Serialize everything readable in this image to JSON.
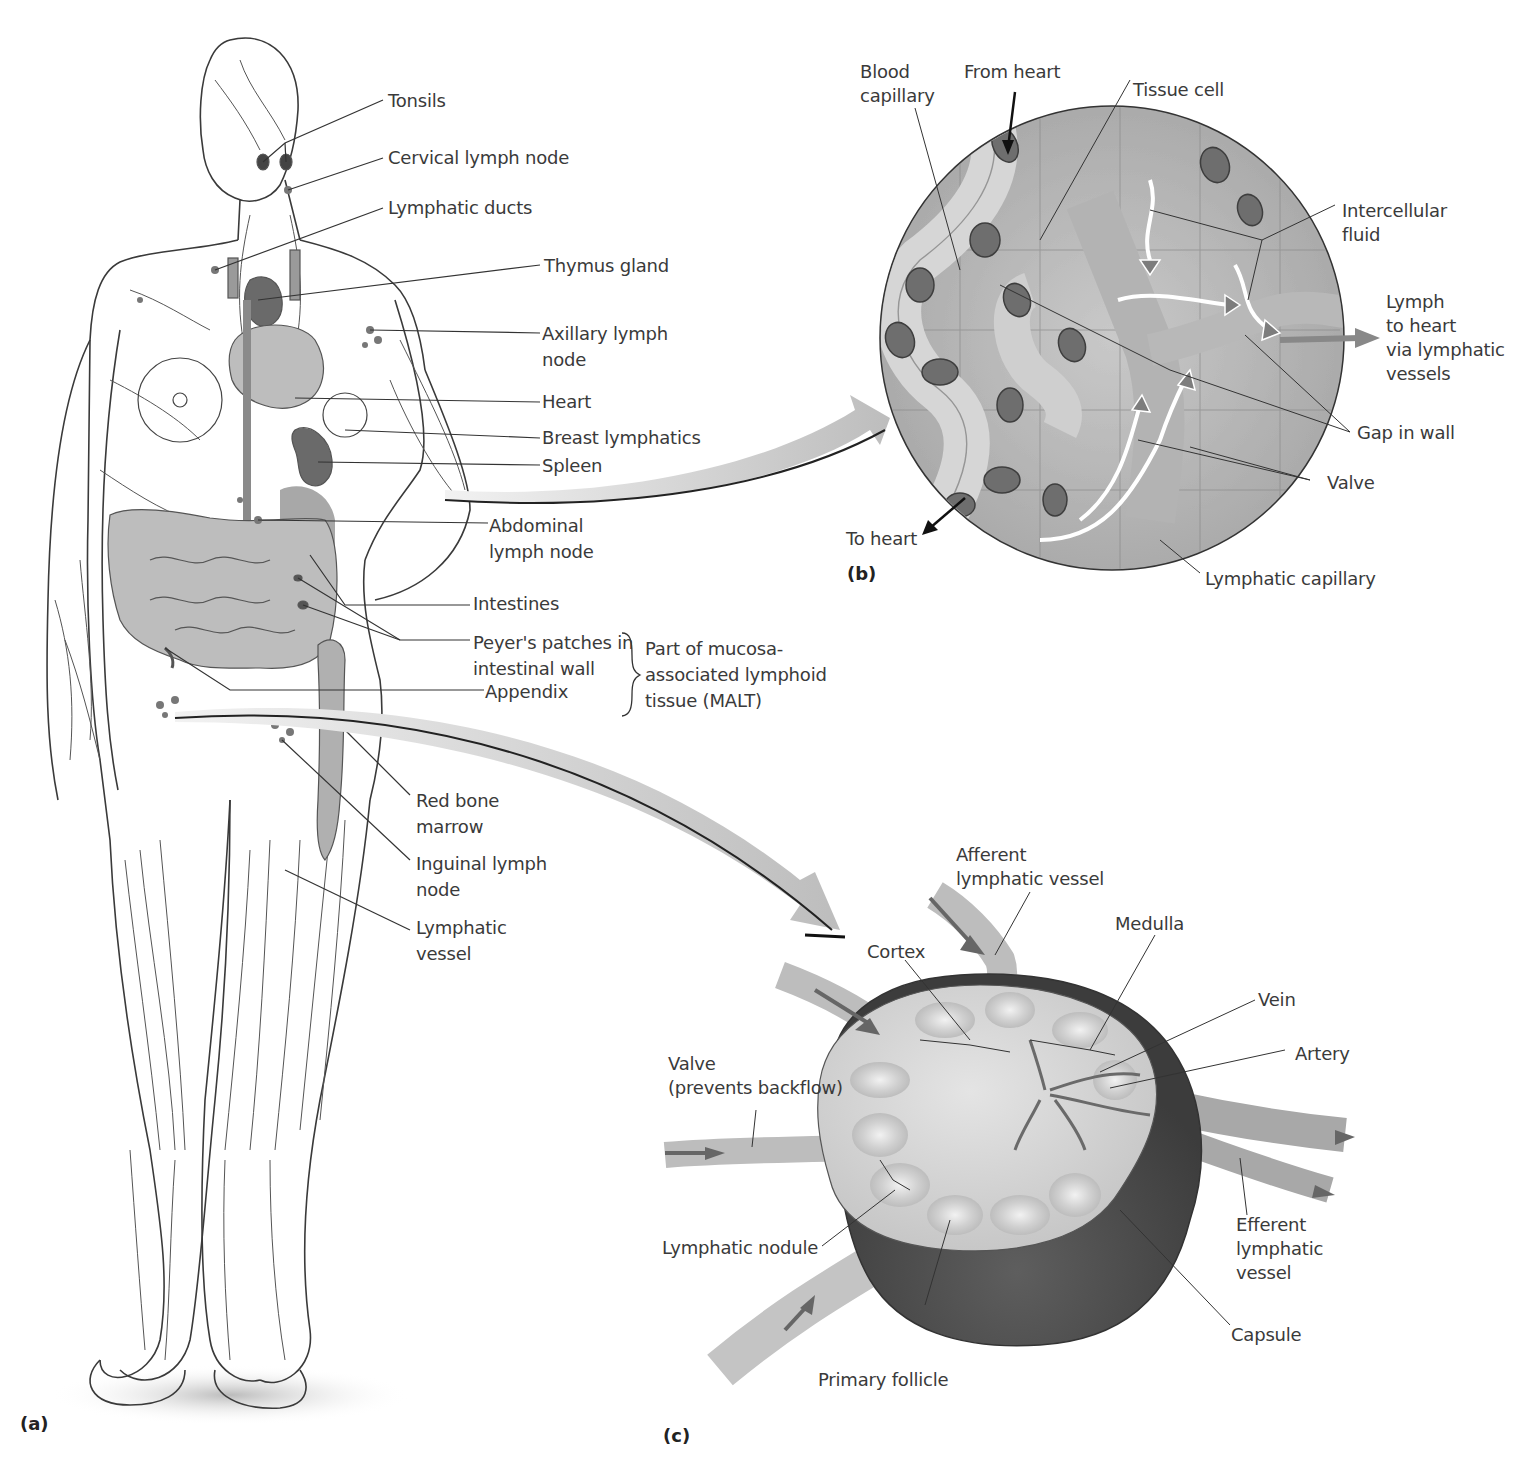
{
  "figure": {
    "panels": {
      "a": "(a)",
      "b": "(b)",
      "c": "(c)"
    },
    "panel_a": {
      "title": "Lymphatic system of the human body",
      "labels": {
        "tonsils": "Tonsils",
        "cervical_lymph_node": "Cervical lymph node",
        "lymphatic_ducts": "Lymphatic ducts",
        "thymus_gland": "Thymus gland",
        "axillary_lymph_node": "Axillary lymph\nnode",
        "heart": "Heart",
        "breast_lymphatics": "Breast lymphatics",
        "spleen": "Spleen",
        "abdominal_lymph_node": "Abdominal\nlymph node",
        "intestines": "Intestines",
        "peyers_patches": "Peyer's patches in\nintestinal wall",
        "appendix": "Appendix",
        "malt_note": "Part of mucosa-\nassociated lymphoid\ntissue (MALT)",
        "red_bone_marrow": "Red bone\nmarrow",
        "inguinal_lymph_node": "Inguinal lymph\nnode",
        "lymphatic_vessel": "Lymphatic\nvessel"
      }
    },
    "panel_b": {
      "title": "Lymphatic capillaries in tissue",
      "labels": {
        "blood_capillary": "Blood\ncapillary",
        "from_heart": "From heart",
        "tissue_cell": "Tissue cell",
        "intercellular_fluid": "Intercellular\nfluid",
        "lymph_to_heart": "Lymph\nto heart\nvia lymphatic\nvessels",
        "gap_in_wall": "Gap in wall",
        "valve": "Valve",
        "to_heart": "To heart",
        "lymphatic_capillary": "Lymphatic capillary"
      }
    },
    "panel_c": {
      "title": "Lymph node cross-section",
      "labels": {
        "afferent_lymphatic_vessel": "Afferent\nlymphatic vessel",
        "medulla": "Medulla",
        "cortex": "Cortex",
        "vein": "Vein",
        "artery": "Artery",
        "valve_prevents_backflow": "Valve\n(prevents backflow)",
        "efferent_lymphatic_vessel": "Efferent\nlymphatic\nvessel",
        "lymphatic_nodule": "Lymphatic nodule",
        "capsule": "Capsule",
        "primary_follicle": "Primary follicle"
      }
    },
    "colors": {
      "label_text": "#3a3a3a",
      "leader_line": "#333333",
      "organ_fill": "#9a9a9a",
      "node_fill": "#555555",
      "tissue_bg": "#b8b8b8",
      "callout_arrow": "#c8c8c8"
    }
  }
}
